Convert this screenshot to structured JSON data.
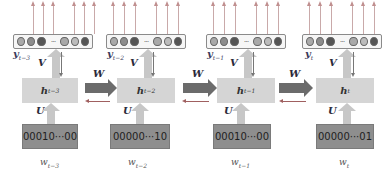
{
  "diagram": {
    "type": "unrolled recurrent neural network language model",
    "weights": {
      "input_to_hidden": "U",
      "hidden_to_output": "V",
      "hidden_to_hidden": "W"
    },
    "steps": [
      {
        "output_label": "y",
        "output_sub": "t−3",
        "hidden_label": "h",
        "hidden_sub": "t−3",
        "input_vector": "00010···00",
        "input_label": "w",
        "input_sub": "t−3",
        "v_label": "V",
        "u_label": "U"
      },
      {
        "output_label": "y",
        "output_sub": "t−2",
        "hidden_label": "h",
        "hidden_sub": "t−2",
        "input_vector": "00000···10",
        "input_label": "w",
        "input_sub": "t−2",
        "v_label": "V",
        "u_label": "U"
      },
      {
        "output_label": "y",
        "output_sub": "t−1",
        "hidden_label": "h",
        "hidden_sub": "t−1",
        "input_vector": "00010···00",
        "input_label": "w",
        "input_sub": "t−1",
        "v_label": "V",
        "u_label": "U"
      },
      {
        "output_label": "y",
        "output_sub": "t",
        "hidden_label": "h",
        "hidden_sub": "t",
        "input_vector": "00000···01",
        "input_label": "w",
        "input_sub": "t",
        "v_label": "V",
        "u_label": "U"
      }
    ],
    "transitions": [
      {
        "label": "W"
      },
      {
        "label": "W"
      },
      {
        "label": "W"
      }
    ],
    "output_units": [
      "light",
      "mid",
      "dark",
      "ellipsis",
      "light",
      "lighter",
      "dark"
    ],
    "ellipsis": "···",
    "colors": {
      "hidden_box": "#d5d5d5",
      "input_box": "#8e8e8e",
      "transition_arrow": "#6b6b6b",
      "feedback_arrow": "#a06060",
      "output_arrow": "#c08f8f",
      "up_arrow": "#c7c7c7"
    }
  }
}
